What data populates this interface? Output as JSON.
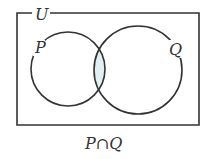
{
  "diagram": {
    "type": "venn",
    "universe_label": "U",
    "sets": [
      {
        "label": "P"
      },
      {
        "label": "Q"
      }
    ],
    "shaded_region": "intersection",
    "caption": "P∩Q",
    "colors": {
      "stroke": "#333333",
      "shade": "#e3f0f3"
    }
  }
}
